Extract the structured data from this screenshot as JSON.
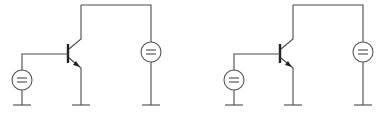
{
  "diagram": {
    "type": "circuit schematic",
    "circuits": [
      {
        "id": "circuit-left",
        "offset_x": 0,
        "components": [
          "npn-transistor",
          "base-dc-source",
          "collector-dc-source",
          "ground",
          "ground",
          "ground"
        ]
      },
      {
        "id": "circuit-right",
        "offset_x": 212,
        "components": [
          "npn-transistor",
          "base-dc-source",
          "collector-dc-source",
          "ground",
          "ground",
          "ground"
        ]
      }
    ],
    "colors": {
      "line": "#4a4a4a",
      "background": "#ffffff"
    }
  }
}
